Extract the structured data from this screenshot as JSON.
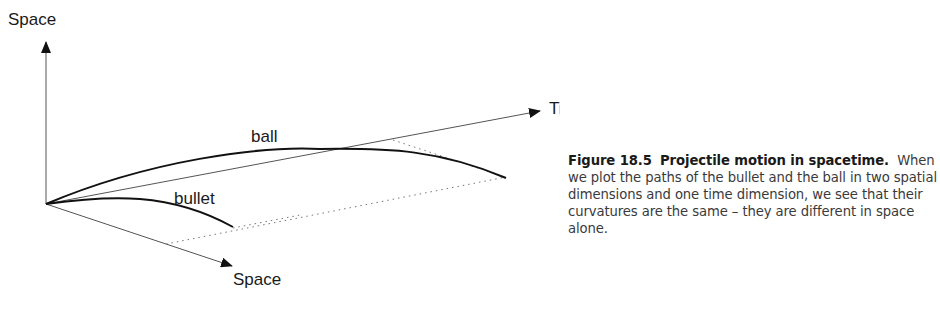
{
  "diagram": {
    "axes": {
      "vertical_label": "Space",
      "time_label": "Time",
      "depth_label": "Space"
    },
    "curves": [
      {
        "name": "ball",
        "label": "ball"
      },
      {
        "name": "bullet",
        "label": "bullet"
      }
    ]
  },
  "caption": {
    "figure_number": "Figure 18.5",
    "title": "Projectile motion in spacetime.",
    "body": "When we plot the paths of the bullet and the ball in two spatial dimensions and one time dimension, we see that their curvatures are the same – they are different in space alone."
  }
}
